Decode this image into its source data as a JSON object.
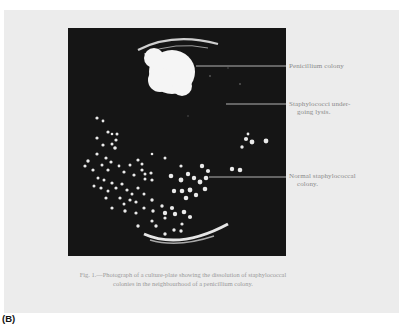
{
  "figure": {
    "panel_label": "(B)",
    "caption_line1": "Fig. 1.—Photograph of a culture-plate showing the dissolution of staphylococcal",
    "caption_line2": "colonies in the neighbourhood of a penicillium colony.",
    "photo_subject": "culture-plate with penicillium colony and staphylococcal colonies",
    "annotations": [
      {
        "line1": "Penicillium colony",
        "line2": ""
      },
      {
        "line1": "Staphylococci  under-",
        "line2": "going lysis."
      },
      {
        "line1": "Normal staphylococcal",
        "line2": "colony."
      }
    ]
  },
  "colors": {
    "page_background": "#ececec",
    "photo_background": "#151515",
    "colony": "#f4f4f4",
    "text": "#8a8a8a"
  }
}
